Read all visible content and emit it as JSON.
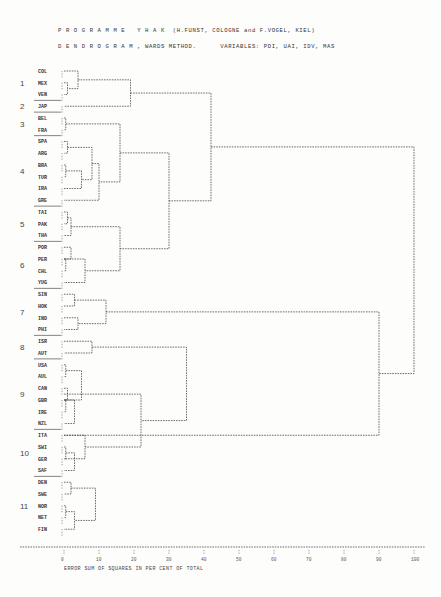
{
  "header": {
    "line1": "P R O G R A M M E   Y H A K  (H.FUNST, COLOGNE and F.VOGEL, KIEL)",
    "line2": "D E N D R O G R A M , WARDS METHOD.      VARIABLES: PDI, UAI, IDV, MAS"
  },
  "chart_data": {
    "type": "dendrogram",
    "xlabel": "ERROR SUM OF SQUARES IN PER CENT OF TOTAL",
    "xlim": [
      0,
      100
    ],
    "x_ticks": [
      "0",
      "10",
      "20",
      "30",
      "40",
      "50",
      "60",
      "70",
      "80",
      "90",
      "100"
    ],
    "leaves": [
      "COL",
      "MEX",
      "VEN",
      "JAP",
      "BEL",
      "FRA",
      "SPA",
      "ARG",
      "BRA",
      "TUR",
      "IRA",
      "GRE",
      "TAI",
      "PAK",
      "THA",
      "POR",
      "PER",
      "CHL",
      "YUG",
      "SIN",
      "HOK",
      "IND",
      "PHI",
      "ISR",
      "AUT",
      "USA",
      "AUL",
      "CAN",
      "GBR",
      "IRE",
      "NZL",
      "ITA",
      "SWI",
      "GER",
      "SAF",
      "DEN",
      "SWE",
      "NOR",
      "NET",
      "FIN"
    ],
    "clusters": [
      {
        "id": "1",
        "members": [
          "COL",
          "MEX",
          "VEN"
        ],
        "first_row": 0
      },
      {
        "id": "2",
        "members": [
          "JAP"
        ],
        "first_row": 3
      },
      {
        "id": "3",
        "members": [
          "BEL",
          "FRA"
        ],
        "first_row": 4
      },
      {
        "id": "4",
        "members": [
          "SPA",
          "ARG",
          "BRA",
          "TUR",
          "IRA",
          "GRE"
        ],
        "first_row": 6
      },
      {
        "id": "5",
        "members": [
          "TAI",
          "PAK",
          "THA"
        ],
        "first_row": 12
      },
      {
        "id": "6",
        "members": [
          "POR",
          "PER",
          "CHL",
          "YUG"
        ],
        "first_row": 15
      },
      {
        "id": "7",
        "members": [
          "SIN",
          "HOK",
          "IND",
          "PHI"
        ],
        "first_row": 19
      },
      {
        "id": "8",
        "members": [
          "ISR",
          "AUT"
        ],
        "first_row": 23
      },
      {
        "id": "9",
        "members": [
          "USA",
          "AUL",
          "CAN",
          "GBR",
          "IRE",
          "NZL"
        ],
        "first_row": 25
      },
      {
        "id": "10",
        "members": [
          "ITA",
          "SWI",
          "GER",
          "SAF"
        ],
        "first_row": 31
      },
      {
        "id": "11",
        "members": [
          "DEN",
          "SWE",
          "NOR",
          "NET",
          "FIN"
        ],
        "first_row": 35
      }
    ],
    "merges": [
      {
        "a": "MEX",
        "b": "VEN",
        "height": 1
      },
      {
        "a": "COL",
        "b": "MEX+VEN",
        "height": 4
      },
      {
        "a": "COL+MEX+VEN",
        "b": "JAP",
        "height": 19
      },
      {
        "a": "BEL",
        "b": "FRA",
        "height": 0.5
      },
      {
        "a": "SPA",
        "b": "ARG",
        "height": 1
      },
      {
        "a": "BRA",
        "b": "TUR",
        "height": 0.5
      },
      {
        "a": "BRA+TUR",
        "b": "IRA",
        "height": 5
      },
      {
        "a": "SPA+ARG",
        "b": "BRA+TUR+IRA",
        "height": 8
      },
      {
        "a": "SPA..IRA",
        "b": "GRE",
        "height": 10
      },
      {
        "a": "BEL+FRA",
        "b": "SPA..GRE",
        "height": 16
      },
      {
        "a": "TAI",
        "b": "PAK",
        "height": 1
      },
      {
        "a": "TAI+PAK",
        "b": "THA",
        "height": 2
      },
      {
        "a": "POR",
        "b": "PER",
        "height": 2
      },
      {
        "a": "PER",
        "b": "CHL",
        "height": 0.5
      },
      {
        "a": "POR+PER+CHL",
        "b": "YUG",
        "height": 6
      },
      {
        "a": "TAI..THA",
        "b": "POR..YUG",
        "height": 16
      },
      {
        "a": "BEL..GRE",
        "b": "TAI..YUG",
        "height": 30
      },
      {
        "a": "COL..JAP",
        "b": "BEL..YUG",
        "height": 42
      },
      {
        "a": "SIN",
        "b": "HOK",
        "height": 3
      },
      {
        "a": "IND",
        "b": "PHI",
        "height": 4
      },
      {
        "a": "SIN+HOK",
        "b": "IND+PHI",
        "height": 12
      },
      {
        "a": "ISR",
        "b": "AUT",
        "height": 8
      },
      {
        "a": "USA",
        "b": "AUL",
        "height": 0.5
      },
      {
        "a": "CAN",
        "b": "GBR",
        "height": 1
      },
      {
        "a": "GBR",
        "b": "IRE",
        "height": 0.5
      },
      {
        "a": "USA+AUL",
        "b": "CAN..IRE",
        "height": 5
      },
      {
        "a": "CAN..IRE",
        "b": "NZL",
        "height": 3
      },
      {
        "a": "ITA",
        "b": "SWI+GER+SAF",
        "height": 6
      },
      {
        "a": "SWI",
        "b": "GER",
        "height": 0.5
      },
      {
        "a": "SWI+GER",
        "b": "SAF",
        "height": 3
      },
      {
        "a": "USA..NZL",
        "b": "ITA..SAF",
        "height": 22
      },
      {
        "a": "ISR+AUT",
        "b": "USA..SAF",
        "height": 35
      },
      {
        "a": "DEN",
        "b": "SWE",
        "height": 2
      },
      {
        "a": "NOR",
        "b": "NET",
        "height": 0.5
      },
      {
        "a": "NOR+NET",
        "b": "FIN",
        "height": 3
      },
      {
        "a": "DEN+SWE",
        "b": "NOR..FIN",
        "height": 9
      },
      {
        "a": "SIN..PHI",
        "b": "ISR..FIN",
        "height": 90
      },
      {
        "a": "COL..YUG",
        "b": "SIN..FIN",
        "height": 100
      }
    ]
  },
  "axis": {
    "label": "ERROR SUM OF SQUARES IN PER CENT OF TOTAL"
  }
}
